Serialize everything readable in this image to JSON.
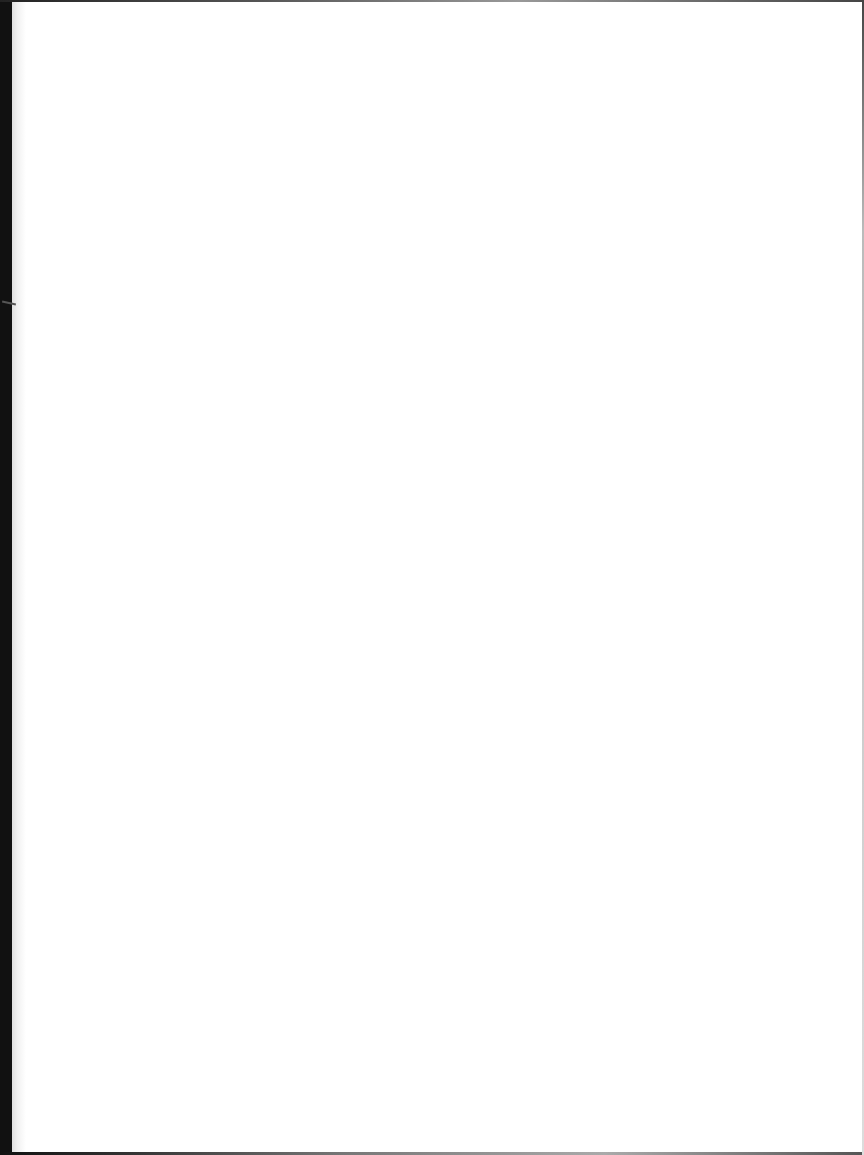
{
  "page": {
    "type": "blank-scanned-page",
    "background_color": "#ffffff",
    "border_color": "#111111",
    "text_content": ""
  }
}
